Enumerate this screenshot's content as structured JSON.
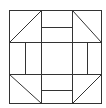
{
  "diagram": {
    "type": "quilt-block",
    "pattern": "churn-dash",
    "stroke_color": "#333333",
    "background_color": "#ffffff",
    "grid": "3x3",
    "outer_square": {
      "x": 9,
      "y": 10,
      "w": 93,
      "h": 94
    },
    "lines_x": [
      41,
      72
    ],
    "lines_y": [
      42,
      74
    ],
    "corner_triangles": [
      "top-left",
      "top-right",
      "bottom-left",
      "bottom-right"
    ],
    "side_bars": [
      "top",
      "bottom",
      "left",
      "right"
    ]
  }
}
